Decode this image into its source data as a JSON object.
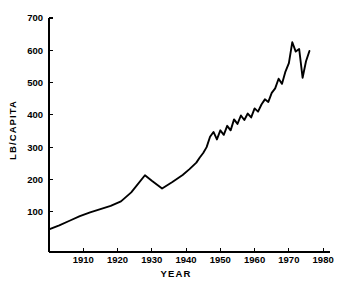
{
  "chart_data": {
    "type": "line",
    "title": "",
    "xlabel": "YEAR",
    "ylabel": "LB/CAPITA",
    "xlim": [
      1900,
      1982
    ],
    "ylim": [
      0,
      700
    ],
    "xticks": [
      1910,
      1920,
      1930,
      1940,
      1950,
      1960,
      1970,
      1980
    ],
    "yticks": [
      100,
      200,
      300,
      400,
      500,
      600,
      700
    ],
    "xtick_labels": [
      "1910",
      "1920",
      "1930",
      "1940",
      "1950",
      "1960",
      "1970",
      "1980"
    ],
    "ytick_labels": [
      "100",
      "200",
      "300",
      "400",
      "500",
      "600",
      "700"
    ],
    "grid": false,
    "legend": false,
    "line_color": "#000000",
    "background_color": "#ffffff",
    "series": [
      {
        "name": "LB/CAPITA",
        "x": [
          1900,
          1903,
          1906,
          1909,
          1912,
          1915,
          1918,
          1921,
          1924,
          1928,
          1930,
          1933,
          1936,
          1939,
          1941,
          1943,
          1944,
          1945,
          1946,
          1947,
          1948,
          1949,
          1950,
          1951,
          1952,
          1953,
          1954,
          1955,
          1956,
          1957,
          1958,
          1959,
          1960,
          1961,
          1962,
          1963,
          1964,
          1965,
          1966,
          1967,
          1968,
          1969,
          1970,
          1971,
          1972,
          1973,
          1974,
          1975,
          1976
        ],
        "y": [
          45,
          58,
          72,
          86,
          98,
          108,
          118,
          132,
          160,
          213,
          196,
          172,
          192,
          214,
          232,
          252,
          268,
          282,
          300,
          332,
          347,
          324,
          352,
          338,
          366,
          352,
          386,
          372,
          398,
          384,
          404,
          392,
          420,
          410,
          432,
          448,
          440,
          468,
          482,
          512,
          496,
          534,
          560,
          625,
          596,
          604,
          515,
          566,
          598
        ]
      }
    ]
  }
}
